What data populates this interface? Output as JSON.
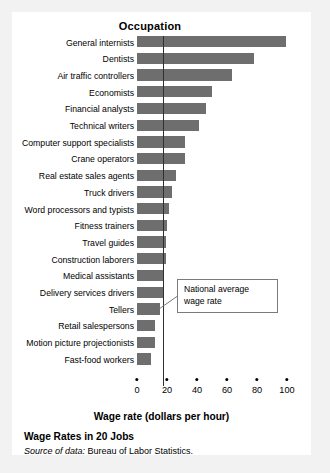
{
  "figure": {
    "title": "Wage Rates in 20 Jobs",
    "source_prefix": "Source of data:",
    "source_text": " Bureau of Labor Statistics.",
    "panel_color": "#ffffff",
    "background_color": "#f2f2f2"
  },
  "annotation": {
    "callout_text": "National average wage rate",
    "callout_line1": "National average",
    "callout_line2": "wage rate"
  },
  "chart_data": {
    "type": "bar",
    "orientation": "horizontal",
    "title": "Wage Rates in 20 Jobs",
    "xlabel": "Wage rate (dollars per hour)",
    "ylabel": "Occupation",
    "xlim": [
      0,
      100
    ],
    "xticks": [
      0,
      20,
      40,
      60,
      80,
      100
    ],
    "xtick_labels": [
      "0",
      "20",
      "40",
      "60",
      "80",
      "100"
    ],
    "grid": false,
    "legend": "none",
    "bar_color": "#6e6e6e",
    "reference_line": {
      "label": "National average wage rate",
      "value": 17,
      "color": "#2f2f2f",
      "orientation": "vertical"
    },
    "categories": [
      "General internists",
      "Dentists",
      "Air traffic controllers",
      "Economists",
      "Financial analysts",
      "Technical writers",
      "Computer support specialists",
      "Crane operators",
      "Real estate sales agents",
      "Truck drivers",
      "Word processors and typists",
      "Fitness trainers",
      "Travel guides",
      "Construction laborers",
      "Medical assistants",
      "Delivery services drivers",
      "Tellers",
      "Retail salespersons",
      "Motion picture projectionists",
      "Fast-food workers"
    ],
    "values": [
      99,
      78,
      63,
      50,
      46,
      41,
      32,
      32,
      26,
      23,
      21,
      20,
      19,
      19,
      18,
      18,
      15,
      12,
      12,
      9
    ]
  }
}
